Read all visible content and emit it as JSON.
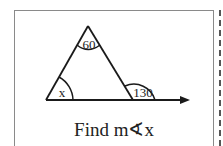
{
  "diagram": {
    "angles": {
      "apex": "60",
      "left": "x",
      "exterior": "130"
    },
    "caption": "Find m∢x"
  }
}
